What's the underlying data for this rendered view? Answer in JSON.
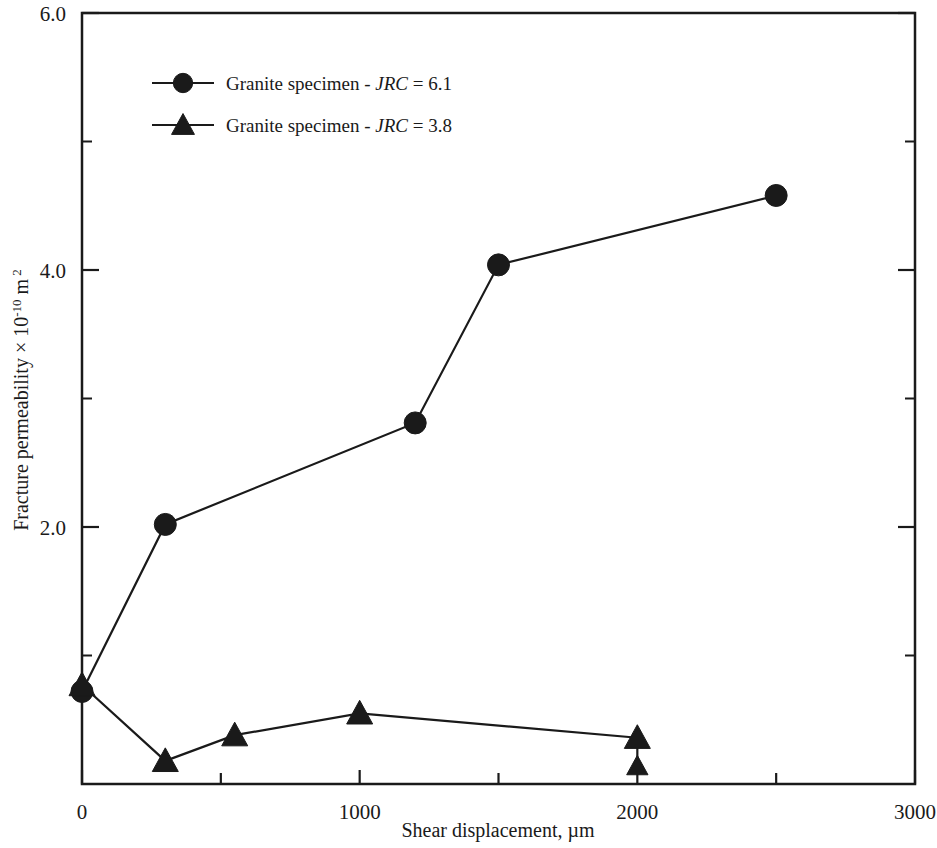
{
  "chart_data": {
    "type": "line",
    "title": "",
    "xlabel": "Shear displacement, µm",
    "ylabel_parts": {
      "main": "Fracture permeability × 10",
      "exponent": "-10",
      "unit": "m",
      "unit_exponent": "2"
    },
    "ylabel": "Fracture permeability × 10 -10 m 2",
    "xlim": [
      0,
      3000
    ],
    "ylim": [
      0,
      6.0
    ],
    "x_ticks": [
      0,
      1000,
      2000,
      3000
    ],
    "x_tick_labels": [
      "0",
      "1000",
      "2000",
      "3000"
    ],
    "x_minor_ticks": [
      500,
      1500,
      2500
    ],
    "y_ticks": [
      2.0,
      4.0,
      6.0
    ],
    "y_tick_labels": [
      "2.0",
      "4.0",
      "6.0"
    ],
    "grid": false,
    "legend_position": "top-left-inside",
    "series": [
      {
        "name": "Granite specimen - JRC = 6.1",
        "legend_prefix": "Granite specimen - ",
        "legend_italic": "JRC",
        "legend_suffix": " = 6.1",
        "marker": "circle",
        "color": "#1a1a1a",
        "points": [
          {
            "x": 0,
            "y": 0.72
          },
          {
            "x": 300,
            "y": 2.02
          },
          {
            "x": 1200,
            "y": 2.81
          },
          {
            "x": 1500,
            "y": 4.04
          },
          {
            "x": 2500,
            "y": 4.58
          }
        ]
      },
      {
        "name": "Granite specimen - JRC = 3.8",
        "legend_prefix": "Granite specimen - ",
        "legend_italic": "JRC",
        "legend_suffix": " = 3.8",
        "marker": "triangle",
        "color": "#1a1a1a",
        "points": [
          {
            "x": 0,
            "y": 0.77
          },
          {
            "x": 300,
            "y": 0.18
          },
          {
            "x": 550,
            "y": 0.38
          },
          {
            "x": 1000,
            "y": 0.55
          },
          {
            "x": 2000,
            "y": 0.36
          }
        ],
        "extra_points": [
          {
            "x": 2000,
            "y": 0.14
          }
        ]
      }
    ]
  },
  "axis": {
    "left_label_0": "",
    "frame_color": "#1a1a1a"
  }
}
